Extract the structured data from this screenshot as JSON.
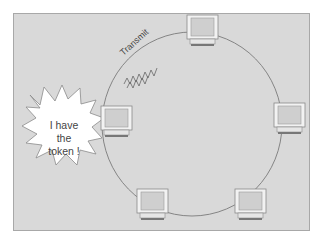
{
  "diagram": {
    "transmit_label": "Transmit",
    "bubble": {
      "lines": [
        "I have",
        "the",
        "token !"
      ]
    },
    "nodes": [
      {
        "id": "top",
        "x": 187,
        "y": 15
      },
      {
        "id": "right",
        "x": 274,
        "y": 103
      },
      {
        "id": "bottom-right",
        "x": 235,
        "y": 189
      },
      {
        "id": "bottom-left",
        "x": 137,
        "y": 189
      },
      {
        "id": "left",
        "x": 101,
        "y": 106
      }
    ],
    "colors": {
      "background": "#d9d9d9",
      "ring": "#6e6e6e",
      "bubble_fill": "#ffffff",
      "computer_frame": "#f0f0f0"
    }
  }
}
